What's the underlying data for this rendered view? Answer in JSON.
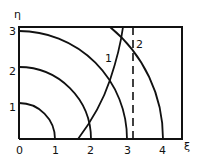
{
  "diagram": {
    "axes": {
      "x_label": "ξ",
      "y_label": "η",
      "x_ticks": [
        "0",
        "1",
        "2",
        "3",
        "4"
      ],
      "y_ticks": [
        "1",
        "2",
        "3"
      ]
    },
    "curve_labels": {
      "curve1": "1",
      "curve2": "2"
    },
    "quarter_circles_radii": [
      1,
      2,
      3,
      4
    ],
    "colors": {
      "stroke": "#111111",
      "background": "#ffffff"
    }
  }
}
